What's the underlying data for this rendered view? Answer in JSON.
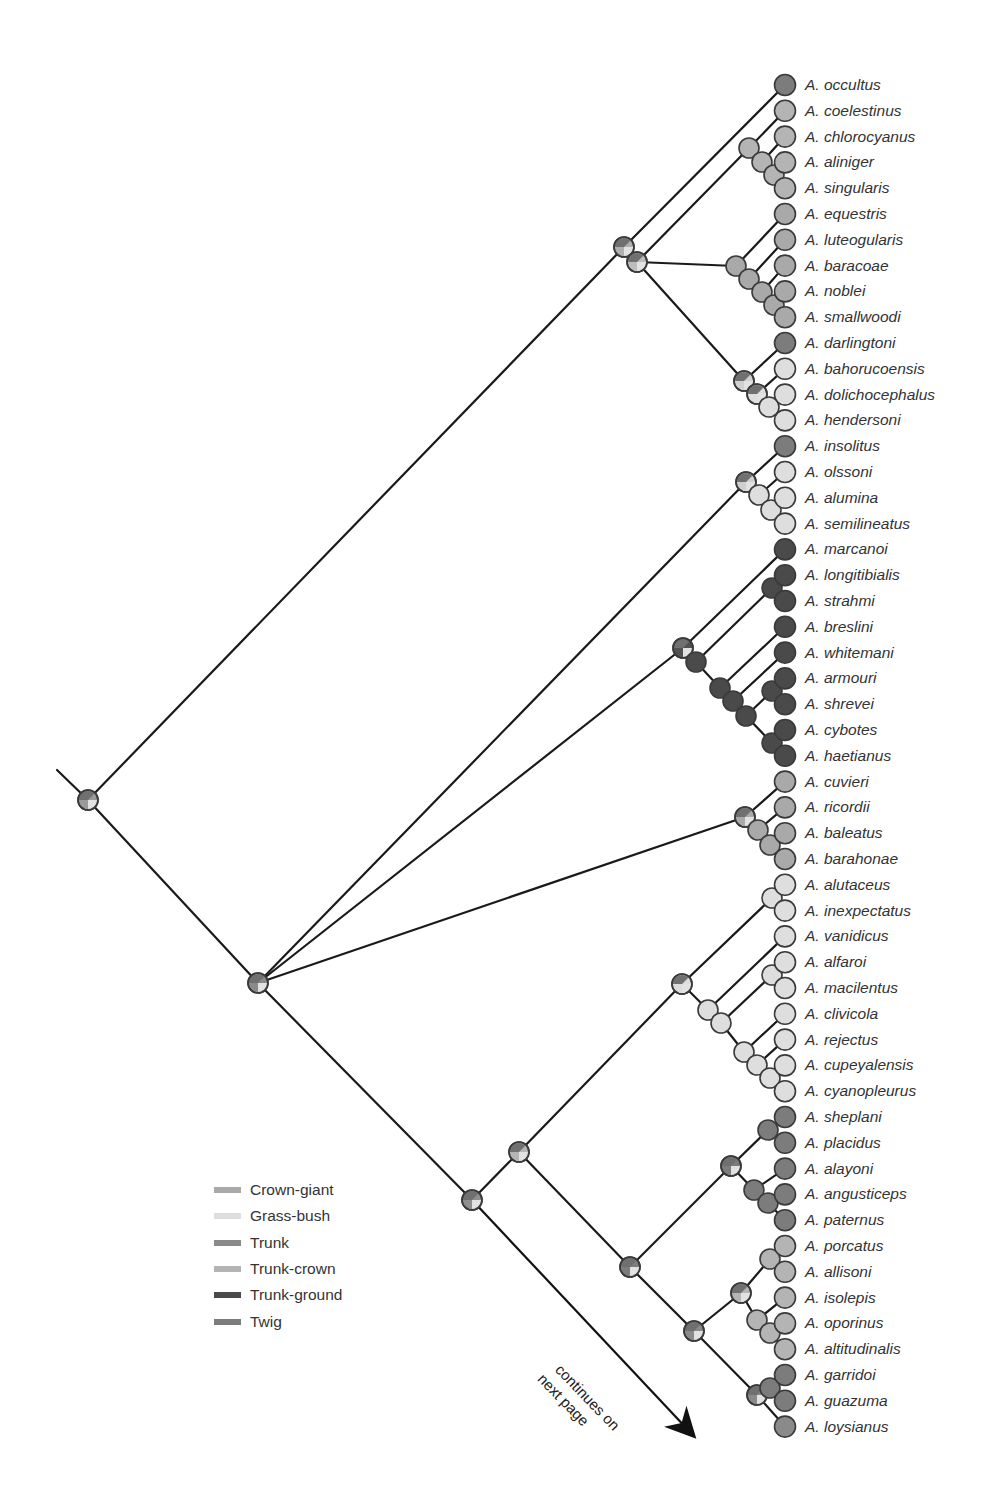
{
  "diagram": {
    "type": "phylogenetic-tree",
    "continuation_note": [
      "continues on",
      "next page"
    ],
    "legend": [
      {
        "label": "Crown-giant",
        "color": "#a9a9a9"
      },
      {
        "label": "Grass-bush",
        "color": "#dedede"
      },
      {
        "label": "Trunk",
        "color": "#8a8a8a"
      },
      {
        "label": "Trunk-crown",
        "color": "#b4b4b4"
      },
      {
        "label": "Trunk-ground",
        "color": "#4a4a4a"
      },
      {
        "label": "Twig",
        "color": "#7c7c7c"
      }
    ],
    "tips": [
      {
        "name": "A. occultus",
        "ecomorph": "Twig"
      },
      {
        "name": "A. coelestinus",
        "ecomorph": "Trunk-crown"
      },
      {
        "name": "A. chlorocyanus",
        "ecomorph": "Trunk-crown"
      },
      {
        "name": "A. aliniger",
        "ecomorph": "Trunk-crown"
      },
      {
        "name": "A. singularis",
        "ecomorph": "Trunk-crown"
      },
      {
        "name": "A. equestris",
        "ecomorph": "Crown-giant"
      },
      {
        "name": "A. luteogularis",
        "ecomorph": "Crown-giant"
      },
      {
        "name": "A. baracoae",
        "ecomorph": "Crown-giant"
      },
      {
        "name": "A. noblei",
        "ecomorph": "Crown-giant"
      },
      {
        "name": "A. smallwoodi",
        "ecomorph": "Crown-giant"
      },
      {
        "name": "A. darlingtoni",
        "ecomorph": "Twig"
      },
      {
        "name": "A. bahorucoensis",
        "ecomorph": "Grass-bush"
      },
      {
        "name": "A. dolichocephalus",
        "ecomorph": "Grass-bush"
      },
      {
        "name": "A. hendersoni",
        "ecomorph": "Grass-bush"
      },
      {
        "name": "A. insolitus",
        "ecomorph": "Twig"
      },
      {
        "name": "A. olssoni",
        "ecomorph": "Grass-bush"
      },
      {
        "name": "A. alumina",
        "ecomorph": "Grass-bush"
      },
      {
        "name": "A. semilineatus",
        "ecomorph": "Grass-bush"
      },
      {
        "name": "A. marcanoi",
        "ecomorph": "Trunk-ground"
      },
      {
        "name": "A. longitibialis",
        "ecomorph": "Trunk-ground"
      },
      {
        "name": "A. strahmi",
        "ecomorph": "Trunk-ground"
      },
      {
        "name": "A. breslini",
        "ecomorph": "Trunk-ground"
      },
      {
        "name": "A. whitemani",
        "ecomorph": "Trunk-ground"
      },
      {
        "name": "A. armouri",
        "ecomorph": "Trunk-ground"
      },
      {
        "name": "A. shrevei",
        "ecomorph": "Trunk-ground"
      },
      {
        "name": "A. cybotes",
        "ecomorph": "Trunk-ground"
      },
      {
        "name": "A. haetianus",
        "ecomorph": "Trunk-ground"
      },
      {
        "name": "A. cuvieri",
        "ecomorph": "Crown-giant"
      },
      {
        "name": "A. ricordii",
        "ecomorph": "Crown-giant"
      },
      {
        "name": "A. baleatus",
        "ecomorph": "Crown-giant"
      },
      {
        "name": "A. barahonae",
        "ecomorph": "Crown-giant"
      },
      {
        "name": "A. alutaceus",
        "ecomorph": "Grass-bush"
      },
      {
        "name": "A. inexpectatus",
        "ecomorph": "Grass-bush"
      },
      {
        "name": "A. vanidicus",
        "ecomorph": "Grass-bush"
      },
      {
        "name": "A. alfaroi",
        "ecomorph": "Grass-bush"
      },
      {
        "name": "A. macilentus",
        "ecomorph": "Grass-bush"
      },
      {
        "name": "A. clivicola",
        "ecomorph": "Grass-bush"
      },
      {
        "name": "A. rejectus",
        "ecomorph": "Grass-bush"
      },
      {
        "name": "A. cupeyalensis",
        "ecomorph": "Grass-bush"
      },
      {
        "name": "A. cyanopleurus",
        "ecomorph": "Grass-bush"
      },
      {
        "name": "A. sheplani",
        "ecomorph": "Twig"
      },
      {
        "name": "A. placidus",
        "ecomorph": "Twig"
      },
      {
        "name": "A. alayoni",
        "ecomorph": "Twig"
      },
      {
        "name": "A. angusticeps",
        "ecomorph": "Twig"
      },
      {
        "name": "A. paternus",
        "ecomorph": "Twig"
      },
      {
        "name": "A. porcatus",
        "ecomorph": "Trunk-crown"
      },
      {
        "name": "A. allisoni",
        "ecomorph": "Trunk-crown"
      },
      {
        "name": "A. isolepis",
        "ecomorph": "Trunk-crown"
      },
      {
        "name": "A. oporinus",
        "ecomorph": "Trunk-crown"
      },
      {
        "name": "A. altitudinalis",
        "ecomorph": "Trunk-crown"
      },
      {
        "name": "A. garridoi",
        "ecomorph": "Twig"
      },
      {
        "name": "A. guazuma",
        "ecomorph": "Twig"
      },
      {
        "name": "A. loysianus",
        "ecomorph": "Trunk"
      }
    ]
  }
}
